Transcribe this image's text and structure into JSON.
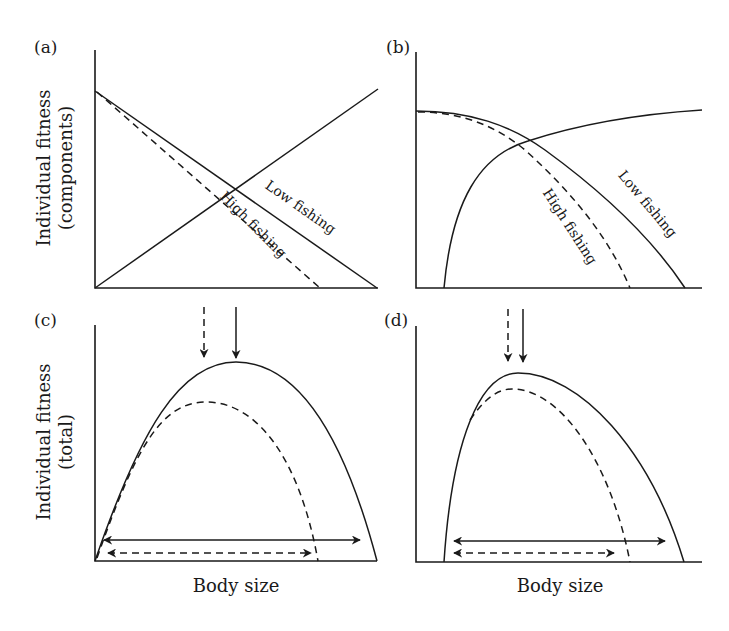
{
  "figure": {
    "panels": [
      {
        "id": "a",
        "label": "(a)"
      },
      {
        "id": "b",
        "label": "(b)"
      },
      {
        "id": "c",
        "label": "(c)"
      },
      {
        "id": "d",
        "label": "(d)"
      }
    ],
    "y_axis_top": {
      "line1": "Individual fitness",
      "line2": "(components)"
    },
    "y_axis_bottom": {
      "line1": "Individual fitness",
      "line2": "(total)"
    },
    "x_axis_left": "Body size",
    "x_axis_right": "Body size",
    "curve_labels": {
      "a_low": "Low fishing",
      "a_high": "High fishing",
      "b_low": "Low fishing",
      "b_high": "High fishing"
    },
    "legend_encoding": {
      "solid": "Low fishing",
      "dashed": "High fishing"
    },
    "colors": {
      "ink": "#1a1a1a",
      "background": "#ffffff"
    }
  }
}
